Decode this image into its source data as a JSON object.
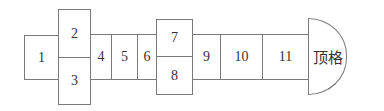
{
  "diagram": {
    "cells": [
      {
        "id": "1",
        "label": "1"
      },
      {
        "id": "2",
        "label": "2"
      },
      {
        "id": "3",
        "label": "3"
      },
      {
        "id": "4",
        "label": "4"
      },
      {
        "id": "5",
        "label": "5"
      },
      {
        "id": "6",
        "label": "6"
      },
      {
        "id": "7",
        "label": "7"
      },
      {
        "id": "8",
        "label": "8"
      },
      {
        "id": "9",
        "label": "9"
      },
      {
        "id": "10",
        "label": "10"
      },
      {
        "id": "11",
        "label": "11"
      },
      {
        "id": "top",
        "label": "顶格"
      }
    ],
    "stroke_color": "#7a7a7a"
  }
}
